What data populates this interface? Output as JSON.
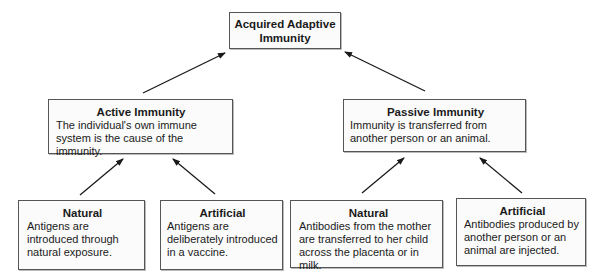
{
  "root": {
    "title": "Acquired Adaptive Immunity"
  },
  "active": {
    "title": "Active Immunity",
    "description": "The individual's own immune system is the cause of the immunity.",
    "natural": {
      "title": "Natural",
      "description": "Antigens are introduced through natural exposure."
    },
    "artificial": {
      "title": "Artificial",
      "description": "Antigens are deliberately introduced in a vaccine."
    }
  },
  "passive": {
    "title": "Passive Immunity",
    "description": "Immunity is transferred from another person or an animal.",
    "natural": {
      "title": "Natural",
      "description": "Antibodies from the mother are transferred to her child across the placenta or in milk."
    },
    "artificial": {
      "title": "Artificial",
      "description": "Antibodies produced by another person or an animal are injected."
    }
  },
  "colors": {
    "border": "#555555",
    "box_fill": "#fbfbfb",
    "arrow": "#1a1a1a"
  }
}
